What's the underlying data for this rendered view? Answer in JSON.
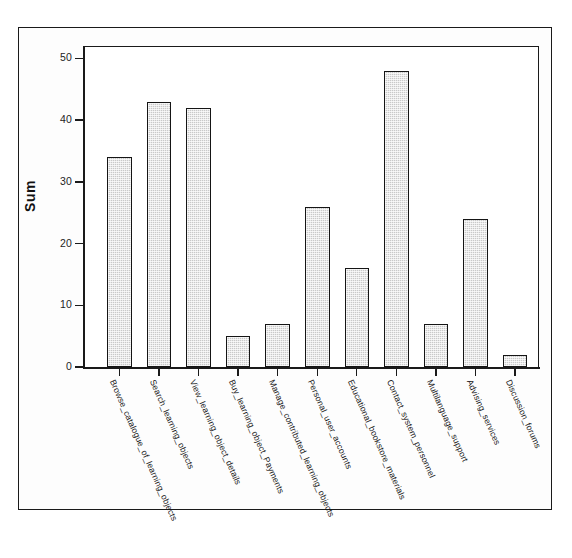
{
  "chart_data": {
    "type": "bar",
    "title": "",
    "xlabel": "",
    "ylabel": "Sum",
    "ylim": [
      0,
      52
    ],
    "yticks": [
      0,
      10,
      20,
      30,
      40,
      50
    ],
    "grid": false,
    "legend": false,
    "categories": [
      "Browse_catalogue_of_learning_objects",
      "Search_learning_objects",
      "View_learning_object_details",
      "Buy_learning_object_Payments",
      "Manage_contributed_learning_objects",
      "Personal_user_accounts",
      "Educational_bookstore_materials",
      "Contact_system_personnel",
      "Multilanguage_support",
      "Advising_services",
      "Discussion_forums"
    ],
    "values": [
      34,
      43,
      42,
      5,
      7,
      26,
      16,
      48,
      7,
      24,
      2
    ],
    "bar_fill_color": "#c9c9c9",
    "bar_edge_color": "#151515"
  },
  "axis": {
    "y_title": "Sum",
    "y_tick_labels": [
      "50",
      "40",
      "30",
      "20",
      "10",
      "0"
    ]
  }
}
